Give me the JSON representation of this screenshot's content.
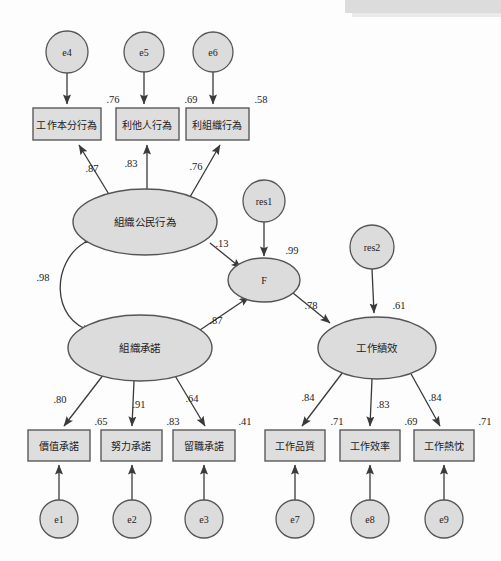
{
  "diagram": {
    "type": "sem-path-diagram",
    "latent_variables": [
      {
        "id": "ocb",
        "label": "組織公民行為",
        "cx": 145,
        "cy": 222,
        "rx": 72,
        "ry": 33
      },
      {
        "id": "commitment",
        "label": "組織承諾",
        "cx": 140,
        "cy": 348,
        "rx": 72,
        "ry": 33
      },
      {
        "id": "f",
        "label": "F",
        "cx": 264,
        "cy": 280,
        "rx": 36,
        "ry": 22
      },
      {
        "id": "performance",
        "label": "工作績效",
        "cx": 377,
        "cy": 348,
        "rx": 59,
        "ry": 31
      }
    ],
    "observed_variables": [
      {
        "id": "v4",
        "label": "工作本分行為",
        "x": 33,
        "y": 108,
        "w": 68,
        "h": 32,
        "r2": ".76"
      },
      {
        "id": "v5",
        "label": "利他人行為",
        "x": 116,
        "y": 108,
        "w": 63,
        "h": 32,
        "r2": ".69"
      },
      {
        "id": "v6",
        "label": "利組織行為",
        "x": 186,
        "y": 108,
        "w": 63,
        "h": 32,
        "r2": ".58"
      },
      {
        "id": "v1",
        "label": "價值承諾",
        "x": 28,
        "y": 430,
        "w": 62,
        "h": 31,
        "r2": ".65"
      },
      {
        "id": "v2",
        "label": "努力承諾",
        "x": 101,
        "y": 430,
        "w": 61,
        "h": 31,
        "r2": ".83"
      },
      {
        "id": "v3",
        "label": "留職承諾",
        "x": 173,
        "y": 430,
        "w": 62,
        "h": 31,
        "r2": ".41"
      },
      {
        "id": "v7",
        "label": "工作品質",
        "x": 265,
        "y": 430,
        "w": 60,
        "h": 31,
        "r2": ".71"
      },
      {
        "id": "v8",
        "label": "工作效率",
        "x": 340,
        "y": 430,
        "w": 60,
        "h": 31,
        "r2": ".69"
      },
      {
        "id": "v9",
        "label": "工作熱忱",
        "x": 414,
        "y": 430,
        "w": 60,
        "h": 31,
        "r2": ".71"
      }
    ],
    "error_terms": [
      {
        "id": "e4",
        "label": "e4",
        "cx": 67,
        "cy": 52,
        "r": 21
      },
      {
        "id": "e5",
        "label": "e5",
        "cx": 144,
        "cy": 52,
        "r": 20
      },
      {
        "id": "e6",
        "label": "e6",
        "cx": 213,
        "cy": 52,
        "r": 20
      },
      {
        "id": "e1",
        "label": "e1",
        "cx": 59,
        "cy": 519,
        "r": 19
      },
      {
        "id": "e2",
        "label": "e2",
        "cx": 132,
        "cy": 519,
        "r": 19
      },
      {
        "id": "e3",
        "label": "e3",
        "cx": 204,
        "cy": 519,
        "r": 19
      },
      {
        "id": "e7",
        "label": "e7",
        "cx": 295,
        "cy": 519,
        "r": 19
      },
      {
        "id": "e8",
        "label": "e8",
        "cx": 370,
        "cy": 519,
        "r": 19
      },
      {
        "id": "e9",
        "label": "e9",
        "cx": 444,
        "cy": 519,
        "r": 19
      }
    ],
    "residual_terms": [
      {
        "id": "res1",
        "label": "res1",
        "cx": 264,
        "cy": 201,
        "r": 21
      },
      {
        "id": "res2",
        "label": "res2",
        "cx": 372,
        "cy": 247,
        "r": 22
      }
    ],
    "paths": [
      {
        "id": "ocb-to-v4",
        "from": "ocb",
        "to": "v4",
        "coefficient": ".87",
        "label_x": 92,
        "label_y": 168
      },
      {
        "id": "ocb-to-v5",
        "from": "ocb",
        "to": "v5",
        "coefficient": ".83",
        "label_x": 131,
        "label_y": 163
      },
      {
        "id": "ocb-to-v6",
        "from": "ocb",
        "to": "v6",
        "coefficient": ".76",
        "label_x": 196,
        "label_y": 166
      },
      {
        "id": "commitment-to-v1",
        "from": "commitment",
        "to": "v1",
        "coefficient": ".80",
        "label_x": 60,
        "label_y": 399
      },
      {
        "id": "commitment-to-v2",
        "from": "commitment",
        "to": "v2",
        "coefficient": ".91",
        "label_x": 139,
        "label_y": 404
      },
      {
        "id": "commitment-to-v3",
        "from": "commitment",
        "to": "v3",
        "coefficient": ".64",
        "label_x": 192,
        "label_y": 398
      },
      {
        "id": "ocb-to-f",
        "from": "ocb",
        "to": "f",
        "coefficient": ".13",
        "label_x": 222,
        "label_y": 243
      },
      {
        "id": "commitment-to-f",
        "from": "commitment",
        "to": "f",
        "coefficient": ".87",
        "label_x": 216,
        "label_y": 320
      },
      {
        "id": "f-to-performance",
        "from": "f",
        "to": "performance",
        "coefficient": ".78",
        "label_x": 311,
        "label_y": 305
      },
      {
        "id": "performance-to-v7",
        "from": "performance",
        "to": "v7",
        "coefficient": ".84",
        "label_x": 308,
        "label_y": 397
      },
      {
        "id": "performance-to-v8",
        "from": "performance",
        "to": "v8",
        "coefficient": ".83",
        "label_x": 383,
        "label_y": 404
      },
      {
        "id": "performance-to-v9",
        "from": "performance",
        "to": "v9",
        "coefficient": ".84",
        "label_x": 435,
        "label_y": 397
      },
      {
        "id": "res1-to-f",
        "from": "res1",
        "to": "f",
        "coefficient": ".99",
        "label_x": 292,
        "label_y": 250
      },
      {
        "id": "res2-to-performance",
        "from": "res2",
        "to": "performance",
        "coefficient": ".61",
        "label_x": 399,
        "label_y": 305
      }
    ],
    "covariance": {
      "id": "ocb-commitment-covariance",
      "between": [
        "ocb",
        "commitment"
      ],
      "coefficient": ".98",
      "label_x": 43,
      "label_y": 277
    },
    "colors": {
      "node_fill": "#dcdcdc",
      "node_stroke": "#555555",
      "edge": "#3a3a3a",
      "background": "#fdfdfd",
      "text": "#1c1c1c"
    }
  }
}
